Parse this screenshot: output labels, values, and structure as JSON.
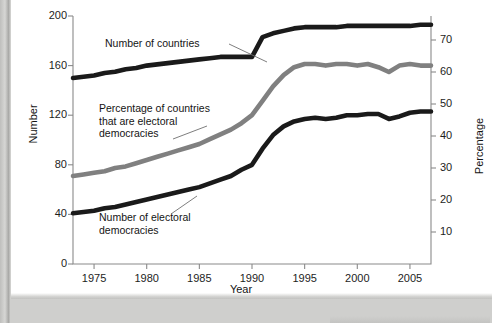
{
  "figure": {
    "background": "#ffffff",
    "page_background": "#cfcfcd"
  },
  "axes": {
    "left": {
      "title": "Number",
      "ticks": [
        "0",
        "40",
        "80",
        "120",
        "160",
        "200"
      ],
      "min": 0,
      "max": 200
    },
    "right": {
      "title": "Percentage",
      "ticks": [
        "10",
        "20",
        "30",
        "40",
        "50",
        "60",
        "70"
      ],
      "min": 0,
      "max": 77.5
    },
    "x": {
      "title": "Year",
      "ticks": [
        "1975",
        "1980",
        "1985",
        "1990",
        "1995",
        "2000",
        "2005"
      ],
      "min": 1973,
      "max": 2007
    }
  },
  "annotations": [
    {
      "name": "number-of-countries",
      "text": "Number of countries"
    },
    {
      "name": "percentage-of-countries",
      "text": "Percentage of countries\nthat are electoral\ndemocracies"
    },
    {
      "name": "number-of-electoral-democracies",
      "text": "Number of electoral\ndemocracies"
    }
  ],
  "colors": {
    "number_of_countries": "#1a1a1a",
    "percentage": "#808080",
    "electoral_democracies": "#1a1a1a",
    "axis": "#8a8a8a",
    "text": "#141414"
  },
  "chart_data": {
    "type": "line",
    "title": "",
    "subtitle": "",
    "xlabel": "Year",
    "ylabel": "Number",
    "y2label": "Percentage",
    "xlim": [
      1973,
      2007
    ],
    "ylim": [
      0,
      200
    ],
    "y2lim": [
      0,
      77.5
    ],
    "grid": false,
    "legend": "in-plot annotations with leader lines",
    "x": [
      1973,
      1974,
      1975,
      1976,
      1977,
      1978,
      1979,
      1980,
      1981,
      1982,
      1983,
      1984,
      1985,
      1986,
      1987,
      1988,
      1989,
      1990,
      1991,
      1992,
      1993,
      1994,
      1995,
      1996,
      1997,
      1998,
      1999,
      2000,
      2001,
      2002,
      2003,
      2004,
      2005,
      2006,
      2007
    ],
    "series": [
      {
        "name": "Number of countries",
        "axis": "left",
        "color": "#1a1a1a",
        "values": [
          150,
          151,
          152,
          154,
          155,
          157,
          158,
          160,
          161,
          162,
          163,
          164,
          165,
          166,
          167,
          167,
          167,
          167,
          183,
          186,
          188,
          190,
          191,
          191,
          191,
          191,
          192,
          192,
          192,
          192,
          192,
          192,
          192,
          193,
          193
        ]
      },
      {
        "name": "Percentage of countries that are electoral democracies",
        "axis": "right",
        "color": "#808080",
        "values": [
          27.5,
          28.0,
          28.5,
          29.0,
          30.0,
          30.5,
          31.5,
          32.5,
          33.5,
          34.5,
          35.5,
          36.5,
          37.5,
          39.0,
          40.5,
          42.0,
          44.0,
          46.5,
          51.0,
          55.5,
          59.0,
          61.5,
          62.5,
          62.5,
          62.0,
          62.5,
          62.5,
          62.0,
          62.5,
          61.5,
          60.0,
          62.0,
          62.5,
          62.0,
          62.0
        ]
      },
      {
        "name": "Number of electoral democracies",
        "axis": "left",
        "color": "#1a1a1a",
        "values": [
          41,
          42,
          43,
          45,
          46,
          48,
          50,
          52,
          54,
          56,
          58,
          60,
          62,
          65,
          68,
          71,
          76,
          80,
          93,
          104,
          111,
          115,
          117,
          118,
          117,
          118,
          120,
          120,
          121,
          121,
          117,
          119,
          122,
          123,
          123
        ]
      }
    ]
  }
}
